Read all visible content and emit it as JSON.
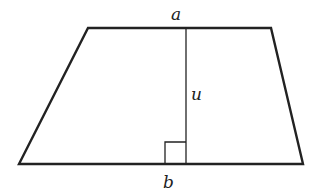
{
  "diagram": {
    "type": "trapezoid",
    "stroke_color": "#222222",
    "background": "#ffffff",
    "vertices": {
      "top_left": [
        88,
        28
      ],
      "top_right": [
        271,
        28
      ],
      "bottom_right": [
        303,
        164
      ],
      "bottom_left": [
        19,
        164
      ]
    },
    "height_line": {
      "x": 186,
      "y1": 28,
      "y2": 164
    },
    "right_angle_marker": {
      "x": 165,
      "y": 143,
      "size": 21
    },
    "labels": {
      "top_base": "a",
      "bottom_base": "b",
      "height": "u"
    }
  }
}
